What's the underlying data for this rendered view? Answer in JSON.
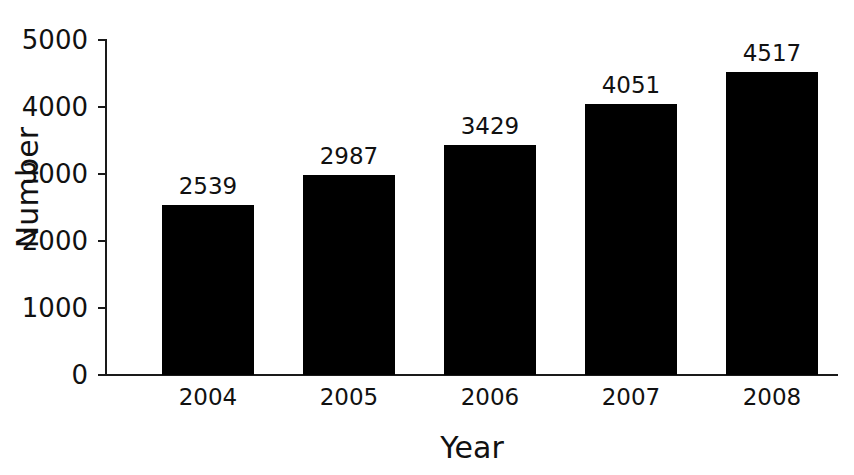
{
  "chart_data": {
    "type": "bar",
    "title": "",
    "subtitle": "",
    "xlabel": "Year",
    "ylabel": "Number",
    "categories": [
      "2004",
      "2005",
      "2006",
      "2007",
      "2008"
    ],
    "values": [
      2539,
      2987,
      3429,
      4051,
      4517
    ],
    "value_labels": [
      "2539",
      "2987",
      "3429",
      "4051",
      "4517"
    ],
    "series": [
      {
        "name": "Number",
        "values": [
          2539,
          2987,
          3429,
          4051,
          4517
        ],
        "color": "#000000"
      }
    ],
    "ylim": [
      0,
      5000
    ],
    "ytick_values": [
      0,
      1000,
      2000,
      3000,
      4000,
      5000
    ],
    "ytick_labels": [
      "0",
      "1000",
      "2000",
      "3000",
      "4000",
      "5000"
    ],
    "grid": false,
    "legend": false,
    "legend_position": "none",
    "axis_color": "#1a1a1a",
    "background_color": "#ffffff",
    "bar_color": "#000000",
    "show_value_labels": true
  }
}
